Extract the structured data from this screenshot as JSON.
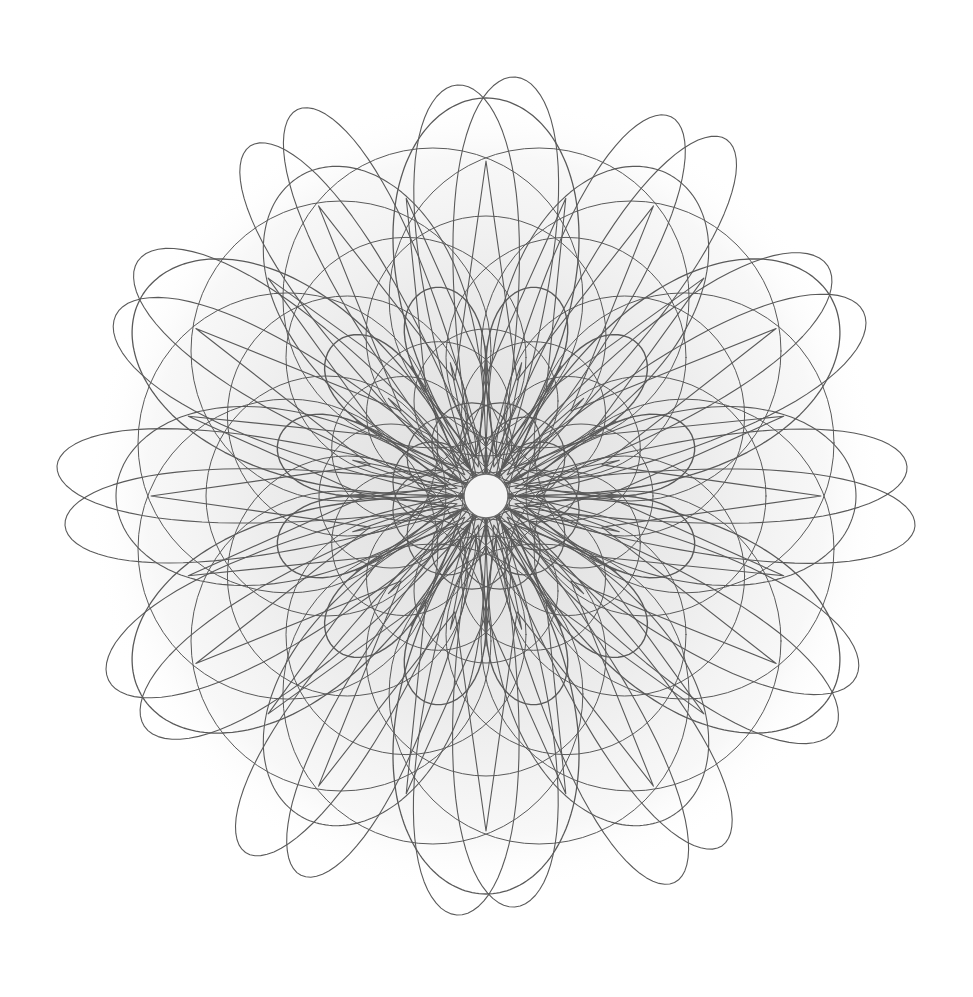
{
  "artwork": {
    "title": "",
    "background": "#ffffff",
    "stroke_color": "#5a5a5a",
    "halo_color": "#e6e6e6",
    "center": [
      486,
      496
    ],
    "center_hole_radius": 22,
    "symmetry": 6,
    "layers": [
      {
        "name": "outer-loops",
        "type": "ellipse-loop",
        "count": 6,
        "angle_offset_deg": 0,
        "length": 430,
        "width": 62,
        "twin_offset_deg": 4,
        "stroke_width": 1.1
      },
      {
        "name": "outer-loops-diagonal",
        "type": "ellipse-loop",
        "count": 6,
        "angle_offset_deg": 30,
        "length": 420,
        "width": 70,
        "twin_offset_deg": 4,
        "stroke_width": 1.1
      },
      {
        "name": "shield-petals",
        "type": "rose",
        "k_petals": 6,
        "angle_offset_deg": 90,
        "radius": 398,
        "width_factor": 0.55,
        "stroke_width": 1.3
      },
      {
        "name": "shield-petals-rotated",
        "type": "rose",
        "k_petals": 6,
        "angle_offset_deg": 60,
        "radius": 370,
        "width_factor": 0.5,
        "stroke_width": 1.1
      },
      {
        "name": "star-lines",
        "type": "star",
        "points": 12,
        "angle_offset_deg": 90,
        "outer_radius": 335,
        "inner_radius": 120,
        "stroke_width": 1.1
      },
      {
        "name": "mid-arcs",
        "type": "circle-ring",
        "count": 12,
        "ring_radius": 205,
        "circle_radius": 150,
        "angle_offset_deg": 15,
        "stroke_width": 1.0
      },
      {
        "name": "mid-arcs-2",
        "type": "circle-ring",
        "count": 12,
        "ring_radius": 160,
        "circle_radius": 120,
        "angle_offset_deg": 0,
        "stroke_width": 1.0
      },
      {
        "name": "inner-teardrops",
        "type": "teardrop",
        "count": 12,
        "angle_offset_deg": 15,
        "inner": 40,
        "outer": 215,
        "width": 52,
        "stroke_width": 1.4
      },
      {
        "name": "inner-circles",
        "type": "circle-ring",
        "count": 12,
        "ring_radius": 95,
        "circle_radius": 72,
        "angle_offset_deg": 0,
        "stroke_width": 1.0
      },
      {
        "name": "core-ring",
        "type": "circle-ring",
        "count": 12,
        "ring_radius": 55,
        "circle_radius": 40,
        "angle_offset_deg": 15,
        "stroke_width": 1.2
      },
      {
        "name": "core-star",
        "type": "star",
        "points": 12,
        "angle_offset_deg": 0,
        "outer_radius": 150,
        "inner_radius": 30,
        "stroke_width": 1.1
      }
    ]
  }
}
